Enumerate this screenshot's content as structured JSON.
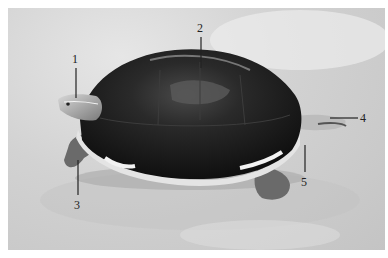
{
  "figure": {
    "colors": {
      "background": "#ffffff",
      "ground": "#d0d0d0",
      "shell": "#141414",
      "plastron_edge": "#e8e8e8",
      "leader_line": "#222222"
    },
    "callouts": [
      {
        "number": "1",
        "target": "head"
      },
      {
        "number": "2",
        "target": "carapace"
      },
      {
        "number": "3",
        "target": "fore-limb"
      },
      {
        "number": "4",
        "target": "tail / hind part"
      },
      {
        "number": "5",
        "target": "plastron edge"
      }
    ]
  }
}
